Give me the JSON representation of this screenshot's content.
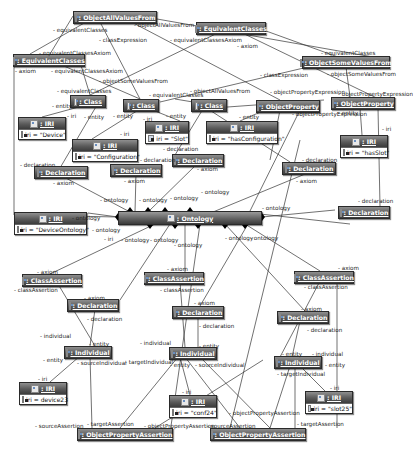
{
  "diagram": {
    "nodes": [
      {
        "id": "n_oavf",
        "name": ": ObjectAllValuesFrom"
      },
      {
        "id": "n_ec1",
        "name": ": EquivalentClasses"
      },
      {
        "id": "n_ec2",
        "name": ": EquivalentClasses"
      },
      {
        "id": "n_osvf",
        "name": ": ObjectSomeValuesFrom"
      },
      {
        "id": "n_class1",
        "name": ": Class"
      },
      {
        "id": "n_class2",
        "name": ": Class"
      },
      {
        "id": "n_class3",
        "name": ": Class"
      },
      {
        "id": "n_op1",
        "name": ": ObjectProperty"
      },
      {
        "id": "n_op2",
        "name": ": ObjectProperty"
      },
      {
        "id": "n_iri_device",
        "name": ": IRI",
        "attr": "iri = \"Device\""
      },
      {
        "id": "n_iri_slot",
        "name": ": IRI",
        "attr": "iri = \"Slot\""
      },
      {
        "id": "n_iri_conf",
        "name": ": IRI",
        "attr": "iri = \"Configuration\""
      },
      {
        "id": "n_iri_hasconf",
        "name": ": IRI",
        "attr": "iri = \"hasConfiguration\""
      },
      {
        "id": "n_iri_hasslot",
        "name": ": IRI",
        "attr": "iri = \"hasSlot\""
      },
      {
        "id": "n_decl1",
        "name": ": Declaration"
      },
      {
        "id": "n_decl2",
        "name": ": Declaration"
      },
      {
        "id": "n_decl3",
        "name": ": Declaration"
      },
      {
        "id": "n_decl4",
        "name": ": Declaration"
      },
      {
        "id": "n_decl5",
        "name": ": Declaration"
      },
      {
        "id": "n_iri_devont",
        "name": ": IRI",
        "attr": "iri = \"DeviceOntology\""
      },
      {
        "id": "n_ontology",
        "name": ": Ontology"
      },
      {
        "id": "n_ca1",
        "name": ": ClassAssertion"
      },
      {
        "id": "n_ca2",
        "name": ": ClassAssertion"
      },
      {
        "id": "n_ca3",
        "name": ": ClassAssertion"
      },
      {
        "id": "n_decl6",
        "name": ": Declaration"
      },
      {
        "id": "n_decl7",
        "name": ": Declaration"
      },
      {
        "id": "n_decl8",
        "name": ": Declaration"
      },
      {
        "id": "n_ind1",
        "name": ": Individual"
      },
      {
        "id": "n_ind2",
        "name": ": Individual"
      },
      {
        "id": "n_ind3",
        "name": ": Individual"
      },
      {
        "id": "n_iri_dev23",
        "name": ": IRI",
        "attr": "iri = device23"
      },
      {
        "id": "n_iri_conf24",
        "name": ": IRI",
        "attr": "iri = \"conf24\""
      },
      {
        "id": "n_iri_slot25",
        "name": ": IRI",
        "attr": "iri = \"slot25\""
      },
      {
        "id": "n_opa1",
        "name": ": ObjectPropertyAssertion"
      },
      {
        "id": "n_opa2",
        "name": ": ObjectPropertyAssertion"
      }
    ],
    "labels": [
      "- equivalentClasses",
      "- classExpression",
      "- objectAllValuesFrom",
      "- equivalentClassesAxiom",
      "- equivalentClassesAxiom",
      "- axiom",
      "- equivalentClassesAxiom",
      "- axiom",
      "- objectSomeValuesFrom",
      "- equivalentClasses",
      "- equivalentClasses",
      "- classExpression",
      "- objectSomeValuesFrom",
      "- objectAllValuesFrom",
      "- equivalentClasses",
      "- objectPropertyExpression",
      "- objectPropertyExpression",
      "- entity",
      "- iri",
      "- entity",
      "- iri",
      "- entity",
      "- entity",
      "- iri",
      "- objectPropertyExpression",
      "- entity",
      "- entity",
      "- iri",
      "- declaration",
      "- declaration",
      "- declaration",
      "- declaration",
      "- declaration",
      "- axiom",
      "- axiom",
      "- axiom",
      "- axiom",
      "- ontology",
      "- ontology",
      "- ontology",
      "- ontology",
      "- ontology",
      "- iri",
      "- ontology",
      "- ontology",
      "- ontology",
      "- ontology",
      "- ontology",
      "- ontology",
      "- ontology",
      "- axiom",
      "- axiom",
      "- axiom",
      "- axiom",
      "- axiom",
      "- axiom",
      "- classAssertion",
      "- classAssertion",
      "- classAssertion",
      "- declaration",
      "- declaration",
      "- declaration",
      "- individual",
      "- individual",
      "- individual",
      "- entity",
      "- entity",
      "- entity",
      "- entity",
      "- entity",
      "- entity",
      "- sourceIndividual",
      "- sourceIndividual",
      "- targetIndividual",
      "- targetIndividual",
      "- iri",
      "- iri",
      "- iri",
      "- sourceAssertion",
      "- targetAssertion",
      "- objectPropertyAssertion",
      "- sourceAssertion",
      "- objectPropertyAssertion",
      "- targetAssertion"
    ]
  }
}
